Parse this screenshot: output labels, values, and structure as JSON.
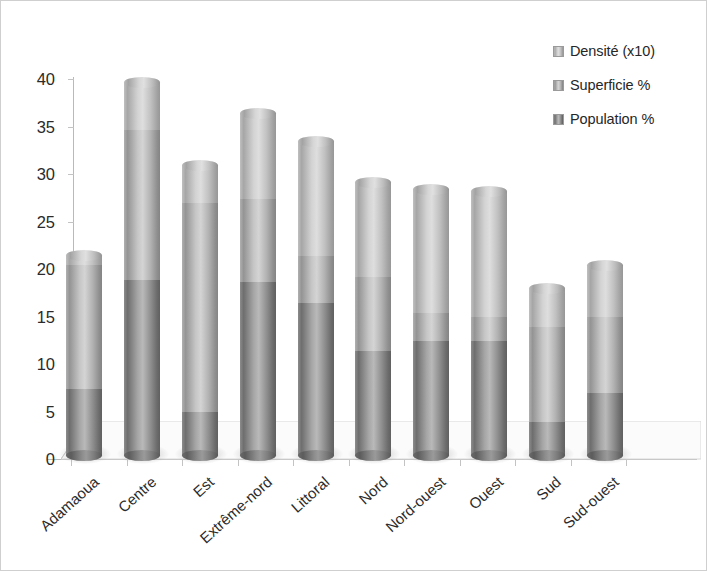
{
  "chart_data": {
    "type": "bar",
    "subtype": "stacked-3d-cylinder",
    "title": "",
    "xlabel": "",
    "ylabel": "",
    "ylim": [
      0,
      40
    ],
    "ytick_step": 5,
    "yticks": [
      "40",
      "35",
      "30",
      "25",
      "20",
      "15",
      "10",
      "5",
      "0"
    ],
    "grid": false,
    "legend_position": "top-right",
    "categories": [
      "Adamaoua",
      "Centre",
      "Est",
      "Extrême-nord",
      "Littoral",
      "Nord",
      "Nord-ouest",
      "Ouest",
      "Sud",
      "Sud-ouest"
    ],
    "series": [
      {
        "name": "Population %",
        "color": "#8f8f8f",
        "values": [
          7.0,
          18.4,
          4.5,
          18.2,
          16.0,
          11.0,
          12.0,
          12.0,
          3.5,
          6.5
        ]
      },
      {
        "name": "Superficie %",
        "color": "#b6b6b6",
        "values": [
          13.0,
          15.8,
          22.0,
          8.8,
          5.0,
          7.7,
          3.0,
          2.5,
          10.0,
          8.0
        ]
      },
      {
        "name": "Densité (x10)",
        "color": "#d0d0d0",
        "values": [
          1.0,
          5.0,
          4.0,
          9.0,
          12.0,
          10.0,
          13.0,
          13.2,
          4.0,
          5.5
        ]
      }
    ],
    "totals": [
      21.0,
      39.2,
      30.5,
      36.0,
      33.0,
      28.7,
      28.0,
      27.7,
      17.5,
      20.0
    ]
  },
  "legend": {
    "items": [
      {
        "label": "Densité (x10)",
        "swatch": "legend-swatch-densite"
      },
      {
        "label": "Superficie %",
        "swatch": "legend-swatch-superficie"
      },
      {
        "label": "Population %",
        "swatch": "legend-swatch-population"
      }
    ]
  }
}
